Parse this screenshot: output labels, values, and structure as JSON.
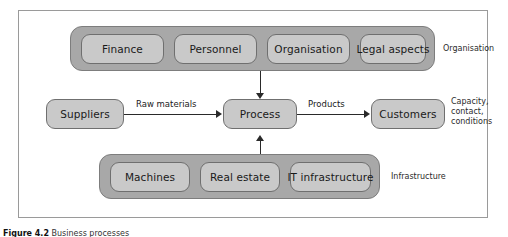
{
  "figure": {
    "caption_number": "Figure 4.2",
    "caption_text": "Business processes"
  },
  "groups": {
    "organisation": {
      "side_label": "Organisation",
      "items": [
        {
          "label": "Finance"
        },
        {
          "label": "Personnel"
        },
        {
          "label": "Organisation"
        },
        {
          "label": "Legal aspects"
        }
      ]
    },
    "infrastructure": {
      "side_label": "Infrastructure",
      "items": [
        {
          "label": "Machines"
        },
        {
          "label": "Real estate"
        },
        {
          "label": "IT infrastructure"
        }
      ]
    }
  },
  "flow": {
    "suppliers": "Suppliers",
    "process": "Process",
    "customers": "Customers",
    "input_label": "Raw materials",
    "output_label": "Products",
    "customer_note": "Capacity,\ncontact,\nconditions"
  },
  "colors": {
    "band_fill": "#a8a8a8",
    "node_fill": "#c9c9c9",
    "node_stroke": "#6f6f6f",
    "frame_stroke": "#9a9a9a",
    "line": "#2a2a2a"
  }
}
